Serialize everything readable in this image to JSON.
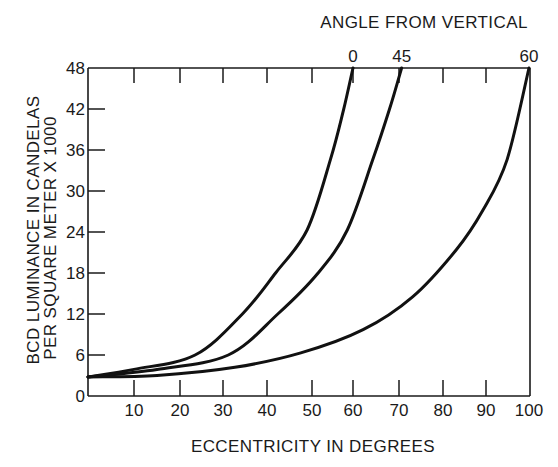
{
  "chart_data": {
    "type": "line",
    "title": "",
    "xlabel": "ECCENTRICITY IN DEGREES",
    "ylabel_line1": "BCD LUMINANCE IN CANDELAS",
    "ylabel_line2": "PER SQUARE METER X 1000",
    "ylabel": "BCD LUMINANCE IN CANDELAS PER SQUARE METER X 1000",
    "top_axis_title": "ANGLE FROM VERTICAL",
    "xlim": [
      0,
      100
    ],
    "ylim": [
      0,
      48
    ],
    "grid": false,
    "legend_position": "curve labels on top axis",
    "x_ticks": [
      10,
      20,
      30,
      40,
      50,
      60,
      70,
      80,
      90,
      100
    ],
    "x_tick_labels": [
      "10",
      "20",
      "30",
      "40",
      "50",
      "60",
      "70",
      "80",
      "90",
      "100"
    ],
    "x_tick_pixels": [
      134,
      180,
      223,
      267,
      312,
      353,
      399,
      443,
      486,
      529
    ],
    "y_ticks": [
      0,
      6,
      12,
      18,
      24,
      30,
      36,
      42,
      48
    ],
    "y_tick_labels": [
      "0",
      "6",
      "12",
      "18",
      "24",
      "30",
      "36",
      "42",
      "48"
    ],
    "series": [
      {
        "name": "0",
        "label": "0",
        "x": [
          0,
          10,
          23.5,
          34.4,
          41.9,
          48.9,
          54.5,
          57.7,
          60
        ],
        "y": [
          2.8,
          3.9,
          6,
          12,
          18,
          24.3,
          34.6,
          41.9,
          48
        ]
      },
      {
        "name": "45",
        "label": "45",
        "x": [
          0,
          15,
          31.2,
          42.4,
          51.5,
          58.6,
          64.3,
          67.9,
          70.6
        ],
        "y": [
          2.8,
          3.9,
          6,
          12,
          18,
          24.3,
          34.6,
          41.9,
          48
        ]
      },
      {
        "name": "60",
        "label": "60",
        "x": [
          0,
          15,
          32.7,
          47.5,
          62.2,
          73.1,
          83.1,
          89.3,
          94.9,
          100
        ],
        "y": [
          2.8,
          3.0,
          4.2,
          6.3,
          9.7,
          14.5,
          21.4,
          27.2,
          34.6,
          48
        ]
      }
    ]
  }
}
